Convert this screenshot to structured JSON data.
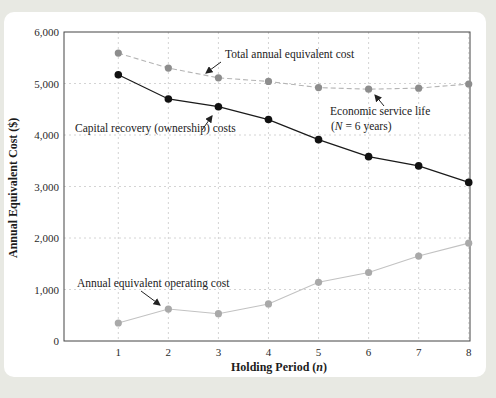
{
  "page": {
    "background_color": "#e8e9e3",
    "panel_color": "#ffffff"
  },
  "chart_data": {
    "type": "line",
    "title": "",
    "xlabel": "Holding Period (n)",
    "xlabel_parts": {
      "pre": "Holding Period (",
      "var": "n",
      "post": ")"
    },
    "ylabel": "Annual Equivalent Cost ($)",
    "x": [
      1,
      2,
      3,
      4,
      5,
      6,
      7,
      8
    ],
    "x_tick_labels": [
      "1",
      "2",
      "3",
      "4",
      "5",
      "6",
      "7",
      "8"
    ],
    "y_ticks": [
      0,
      1000,
      2000,
      3000,
      4000,
      5000,
      6000
    ],
    "y_tick_labels": [
      "0",
      "1,000",
      "2,000",
      "3,000",
      "4,000",
      "5,000",
      "6,000"
    ],
    "ylim": [
      0,
      6000
    ],
    "grid": "dashed-both-axes",
    "legend_position": "none",
    "series": [
      {
        "name": "Annual equivalent operating cost",
        "values": [
          350,
          620,
          530,
          720,
          1140,
          1330,
          1650,
          1900
        ],
        "line_style": "solid",
        "line_color": "#c2c2c2",
        "marker": "circle",
        "marker_color": "#a9a9a9"
      },
      {
        "name": "Total annual equivalent cost",
        "values": [
          5590,
          5300,
          5110,
          5040,
          4920,
          4890,
          4910,
          4990
        ],
        "line_style": "dashed",
        "line_color": "#b4b4b4",
        "marker": "circle",
        "marker_color": "#8d8d8d"
      },
      {
        "name": "Capital recovery (ownership) costs",
        "values": [
          5170,
          4700,
          4550,
          4300,
          3910,
          3580,
          3400,
          3080
        ],
        "line_style": "solid",
        "line_color": "#1a1a1a",
        "marker": "circle",
        "marker_color": "#111111"
      }
    ],
    "annotations": {
      "total": {
        "text": "Total annual equivalent cost"
      },
      "capital": {
        "text": "Capital recovery (ownership) costs"
      },
      "esl": {
        "line1": "Economic service life",
        "line2_parts": {
          "pre": "(",
          "var": "N",
          "post": " = 6 years)"
        },
        "points_to_x": 6
      },
      "operating": {
        "text": "Annual equivalent operating cost"
      }
    }
  }
}
